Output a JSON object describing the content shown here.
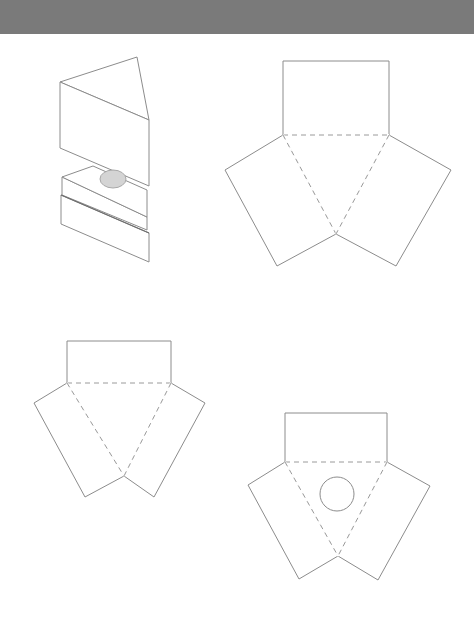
{
  "header": {
    "color": "#7a7a7a",
    "height": 34
  },
  "colors": {
    "stroke": "#8c8c8c",
    "dash": "#9a9a9a",
    "fill_hole": "#d4d4d4",
    "background": "#ffffff"
  },
  "figures": [
    {
      "id": "prism-3d",
      "kind": "exploded-isometric-prism",
      "top_triangle": [
        [
          60,
          82
        ],
        [
          137,
          57
        ],
        [
          149,
          120
        ]
      ],
      "front_face": [
        [
          60,
          82
        ],
        [
          149,
          120
        ],
        [
          149,
          186
        ],
        [
          60,
          148
        ]
      ],
      "base_top_face": [
        [
          62,
          177
        ],
        [
          93,
          166
        ],
        [
          147,
          190
        ],
        [
          147,
          217
        ]
      ],
      "base_slab_1": [
        [
          62,
          177
        ],
        [
          147,
          217
        ],
        [
          147,
          230
        ],
        [
          62,
          195
        ]
      ],
      "base_slab_2": [
        [
          61,
          195
        ],
        [
          149,
          233
        ],
        [
          149,
          262
        ],
        [
          61,
          224
        ]
      ],
      "hole": {
        "cx": 113,
        "cy": 179,
        "rx": 13,
        "ry": 9
      }
    },
    {
      "id": "net-large",
      "kind": "prism-net",
      "rect": [
        [
          283,
          61
        ],
        [
          389,
          61
        ],
        [
          389,
          135
        ],
        [
          283,
          135
        ]
      ],
      "fold_base": [
        [
          283,
          135
        ],
        [
          389,
          135
        ]
      ],
      "apex": [
        336,
        234
      ],
      "left_wing": [
        [
          283,
          135
        ],
        [
          225,
          170
        ],
        [
          277,
          266
        ],
        [
          336,
          234
        ]
      ],
      "right_wing": [
        [
          389,
          135
        ],
        [
          451,
          170
        ],
        [
          396,
          266
        ],
        [
          336,
          234
        ]
      ]
    },
    {
      "id": "net-small",
      "kind": "prism-net",
      "rect": [
        [
          67,
          341
        ],
        [
          171,
          341
        ],
        [
          171,
          383
        ],
        [
          67,
          383
        ]
      ],
      "fold_base": [
        [
          67,
          383
        ],
        [
          171,
          383
        ]
      ],
      "apex": [
        124,
        476
      ],
      "left_wing": [
        [
          67,
          383
        ],
        [
          34,
          403
        ],
        [
          85,
          497
        ],
        [
          124,
          476
        ]
      ],
      "right_wing": [
        [
          171,
          383
        ],
        [
          205,
          403
        ],
        [
          154,
          497
        ],
        [
          124,
          476
        ]
      ]
    },
    {
      "id": "net-with-hole",
      "kind": "prism-net",
      "rect": [
        [
          285,
          413
        ],
        [
          387,
          413
        ],
        [
          387,
          462
        ],
        [
          285,
          462
        ]
      ],
      "fold_base": [
        [
          285,
          462
        ],
        [
          387,
          462
        ]
      ],
      "apex": [
        338,
        556
      ],
      "left_wing": [
        [
          285,
          462
        ],
        [
          248,
          485
        ],
        [
          299,
          579
        ],
        [
          338,
          556
        ]
      ],
      "right_wing": [
        [
          387,
          462
        ],
        [
          430,
          486
        ],
        [
          378,
          580
        ],
        [
          338,
          556
        ]
      ],
      "hole": {
        "cx": 337,
        "cy": 494,
        "r": 17
      }
    }
  ]
}
